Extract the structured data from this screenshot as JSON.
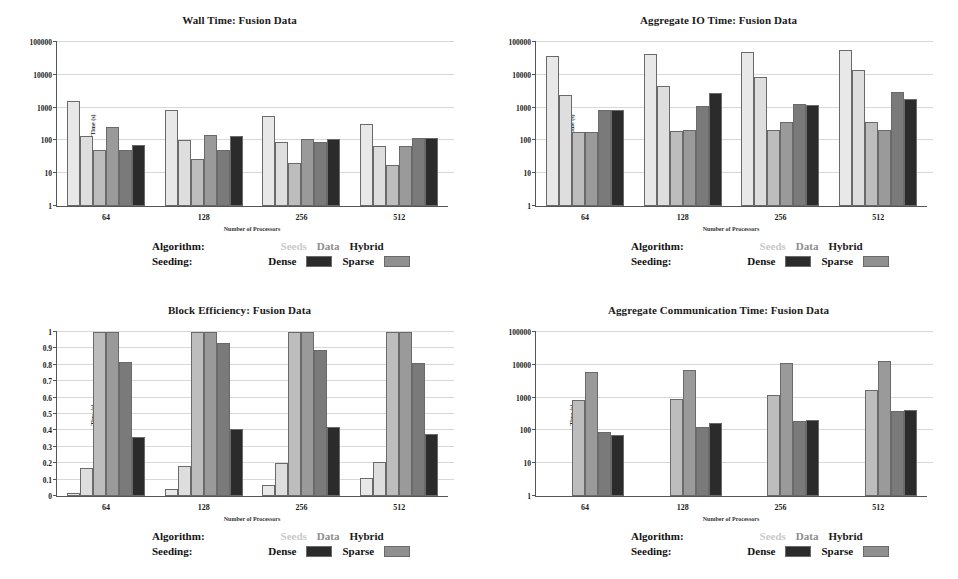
{
  "figure": {
    "panels": [
      "wall_time",
      "aggregate_io_time",
      "block_efficiency",
      "aggregate_communication_time"
    ],
    "xlabel": "Number of Processors",
    "ylabel": "Time (s)",
    "legend": {
      "algorithm_key": "Algorithm:",
      "seeding_key": "Seeding:",
      "algorithm_items": [
        "Seeds",
        "Data",
        "Hybrid"
      ],
      "seeding_items": [
        "Dense",
        "Sparse"
      ],
      "dense_swatch": "#2b2b2b",
      "sparse_swatch": "#909090"
    },
    "colors": {
      "seeds_dense": "#e8e8e8",
      "seeds_sparse": "#dedede",
      "data_dense": "#bdbdbd",
      "data_sparse": "#9a9a9a",
      "hybrid_dense": "#7a7a7a",
      "hybrid_sparse": "#2b2b2b",
      "gridline": "#d8d8d8",
      "axis": "#555555"
    }
  },
  "chart_data": [
    {
      "id": "wall_time",
      "type": "bar",
      "title": "Wall Time: Fusion Data",
      "xlabel": "Number of Processors",
      "ylabel": "Time (s)",
      "yscale": "log",
      "ylim": [
        1,
        100000
      ],
      "yticks": [
        1,
        10,
        100,
        1000,
        10000,
        100000
      ],
      "ytick_labels": [
        "1",
        "10",
        "100",
        "1000",
        "10000",
        "100000"
      ],
      "categories": [
        "64",
        "128",
        "256",
        "512"
      ],
      "grid": true,
      "legend_position": "below",
      "series": [
        {
          "name": "Seeds Dense",
          "values": [
            1600,
            870,
            540,
            320
          ]
        },
        {
          "name": "Seeds Sparse",
          "values": [
            135,
            102,
            90,
            68
          ]
        },
        {
          "name": "Data Dense",
          "values": [
            52,
            27,
            21,
            18
          ]
        },
        {
          "name": "Data Sparse",
          "values": [
            265,
            143,
            110,
            66
          ]
        },
        {
          "name": "Hybrid Dense",
          "values": [
            50,
            52,
            92,
            120
          ]
        },
        {
          "name": "Hybrid Sparse",
          "values": [
            73,
            138,
            108,
            122
          ]
        }
      ]
    },
    {
      "id": "aggregate_io_time",
      "type": "bar",
      "title": "Aggregate IO Time: Fusion Data",
      "xlabel": "Number of Processors",
      "ylabel": "Time (s)",
      "yscale": "log",
      "ylim": [
        1,
        100000
      ],
      "yticks": [
        1,
        10,
        100,
        1000,
        10000,
        100000
      ],
      "ytick_labels": [
        "1",
        "10",
        "100",
        "1000",
        "10000",
        "100000"
      ],
      "categories": [
        "64",
        "128",
        "256",
        "512"
      ],
      "grid": true,
      "legend_position": "below",
      "series": [
        {
          "name": "Seeds Dense",
          "values": [
            38000,
            44000,
            50000,
            57000
          ]
        },
        {
          "name": "Seeds Sparse",
          "values": [
            2500,
            4700,
            8600,
            14500
          ]
        },
        {
          "name": "Data Dense",
          "values": [
            180,
            190,
            210,
            370
          ]
        },
        {
          "name": "Data Sparse",
          "values": [
            180,
            205,
            370,
            215
          ]
        },
        {
          "name": "Hybrid Dense",
          "values": [
            860,
            1100,
            1300,
            2900
          ]
        },
        {
          "name": "Hybrid Sparse",
          "values": [
            870,
            2700,
            1180,
            1800
          ]
        }
      ]
    },
    {
      "id": "block_efficiency",
      "type": "bar",
      "title": "Block Efficiency: Fusion Data",
      "xlabel": "Number of Processors",
      "ylabel": "Time (s)",
      "yscale": "linear",
      "ylim": [
        0,
        1
      ],
      "yticks": [
        0,
        0.1,
        0.2,
        0.3,
        0.4,
        0.5,
        0.6,
        0.7,
        0.8,
        0.9,
        1
      ],
      "ytick_labels": [
        "0",
        "0.1",
        "0.2",
        "0.3",
        "0.4",
        "0.5",
        "0.6",
        "0.7",
        "0.8",
        "0.9",
        "1"
      ],
      "categories": [
        "64",
        "128",
        "256",
        "512"
      ],
      "grid": true,
      "legend_position": "below",
      "series": [
        {
          "name": "Seeds Dense",
          "values": [
            0.02,
            0.04,
            0.07,
            0.11
          ]
        },
        {
          "name": "Seeds Sparse",
          "values": [
            0.17,
            0.18,
            0.2,
            0.21
          ]
        },
        {
          "name": "Data Dense",
          "values": [
            1.0,
            1.0,
            1.0,
            1.0
          ]
        },
        {
          "name": "Data Sparse",
          "values": [
            1.0,
            1.0,
            1.0,
            1.0
          ]
        },
        {
          "name": "Hybrid Dense",
          "values": [
            0.82,
            0.93,
            0.89,
            0.81
          ]
        },
        {
          "name": "Hybrid Sparse",
          "values": [
            0.36,
            0.41,
            0.42,
            0.38
          ]
        }
      ]
    },
    {
      "id": "aggregate_communication_time",
      "type": "bar",
      "title": "Aggregate Communication Time: Fusion Data",
      "xlabel": "Number of Processors",
      "ylabel": "Time (s)",
      "yscale": "log",
      "ylim": [
        1,
        100000
      ],
      "yticks": [
        1,
        10,
        100,
        1000,
        10000,
        100000
      ],
      "ytick_labels": [
        "1",
        "10",
        "100",
        "1000",
        "10000",
        "100000"
      ],
      "categories": [
        "64",
        "128",
        "256",
        "512"
      ],
      "grid": true,
      "legend_position": "below",
      "series": [
        {
          "name": "Seeds Dense",
          "values": [
            0,
            0,
            0,
            0
          ]
        },
        {
          "name": "Seeds Sparse",
          "values": [
            0,
            0,
            0,
            0
          ]
        },
        {
          "name": "Data Dense",
          "values": [
            830,
            880,
            1200,
            1750
          ]
        },
        {
          "name": "Data Sparse",
          "values": [
            6200,
            6800,
            11000,
            12800
          ]
        },
        {
          "name": "Hybrid Dense",
          "values": [
            88,
            125,
            200,
            395
          ]
        },
        {
          "name": "Hybrid Sparse",
          "values": [
            70,
            165,
            215,
            430
          ]
        }
      ]
    }
  ]
}
